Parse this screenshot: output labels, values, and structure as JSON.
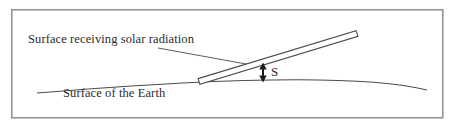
{
  "figure": {
    "type": "physics-diagram",
    "labels": {
      "receiving_surface": "Surface receiving solar radiation",
      "earth_surface": "Surface of the Earth",
      "distance": "S"
    },
    "colors": {
      "frame_border": "#929292",
      "line": "#4c4c4c",
      "bar_fill": "#ffffff",
      "arrow": "#1c1c1c",
      "background": "#ffffff"
    }
  }
}
